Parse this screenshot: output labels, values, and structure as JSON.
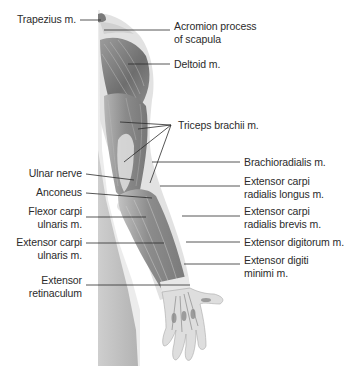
{
  "figure": {
    "labels_left": [
      {
        "id": "trapezius",
        "lines": [
          "Trapezius m."
        ]
      },
      {
        "id": "ulnar-nerve",
        "lines": [
          "Ulnar nerve"
        ]
      },
      {
        "id": "anconeus",
        "lines": [
          "Anconeus"
        ]
      },
      {
        "id": "flexor-carpi-ulnaris",
        "lines": [
          "Flexor carpi",
          "ulnaris m."
        ]
      },
      {
        "id": "extensor-carpi-ulnaris",
        "lines": [
          "Extensor carpi",
          "ulnaris m."
        ]
      },
      {
        "id": "extensor-retinaculum",
        "lines": [
          "Extensor",
          "retinaculum"
        ]
      }
    ],
    "labels_right": [
      {
        "id": "acromion",
        "lines": [
          "Acromion process",
          "of scapula"
        ]
      },
      {
        "id": "deltoid",
        "lines": [
          "Deltoid m."
        ]
      },
      {
        "id": "triceps",
        "lines": [
          "Triceps brachii m."
        ]
      },
      {
        "id": "brachioradialis",
        "lines": [
          "Brachioradialis m."
        ]
      },
      {
        "id": "ecrl",
        "lines": [
          "Extensor carpi",
          "radialis longus m."
        ]
      },
      {
        "id": "ecrb",
        "lines": [
          "Extensor carpi",
          "radialis brevis m."
        ]
      },
      {
        "id": "extensor-digitorum",
        "lines": [
          "Extensor digitorum m."
        ]
      },
      {
        "id": "extensor-digiti-minimi",
        "lines": [
          "Extensor digiti",
          "minimi m."
        ]
      }
    ],
    "colors": {
      "muscle_dark": "#6f6f6f",
      "muscle_mid": "#9a9a9a",
      "skin_light": "#d9d9d9",
      "torso_strip": "#bdbdbd",
      "leader_line": "#2b2b2b",
      "text": "#2b2b2b"
    }
  }
}
